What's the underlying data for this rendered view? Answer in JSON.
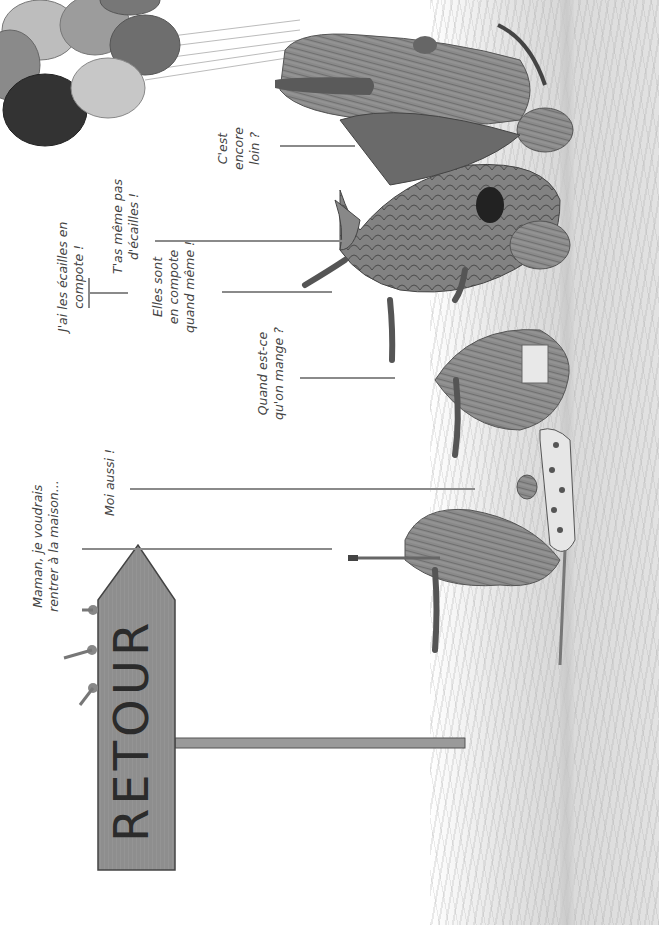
{
  "page": {
    "orientation": "rotated-90-ccw",
    "palette": {
      "background": "#ffffff",
      "ink": "#3a3a3a",
      "line": "#8a8a8a",
      "grass": "#dcdcdc",
      "sign_wood": "#8f8f8f",
      "creature_fur": "#7a7a7a",
      "dragon_scales": "#777777",
      "balloon_dark": "#3c3c3c",
      "balloon_mid": "#8c8c8c",
      "balloon_light": "#c8c8c8"
    }
  },
  "dialogue": [
    {
      "id": "maman",
      "text": "Maman, je voudrais\nrentrer à la maison..."
    },
    {
      "id": "moi-aussi",
      "text": "Moi aussi !"
    },
    {
      "id": "ecailles",
      "text": "J'ai les écailles en\ncompote !"
    },
    {
      "id": "meme-pas",
      "text": "T'as même pas\nd'écailles !"
    },
    {
      "id": "elles-sont",
      "text": "Elles sont\nen compote\nquand même !"
    },
    {
      "id": "quand-mange",
      "text": "Quand est-ce\nqu'on mange ?"
    },
    {
      "id": "encore-loin",
      "text": "C'est\nencore\nloin ?"
    }
  ],
  "signpost": {
    "text": "RETOUR"
  },
  "illustration": {
    "elements": [
      "balloon-bunch",
      "furry-creature-with-balloons",
      "dragon",
      "round-furry-creature",
      "polka-dot-creature",
      "small-furry-creature-with-toothbrush",
      "retour-signpost",
      "grass-field"
    ]
  }
}
